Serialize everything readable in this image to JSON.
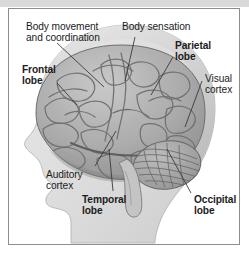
{
  "figure": {
    "frame_color": "#8d8d8d",
    "top_band_color": "#d9d9d9",
    "background_color": "#ffffff",
    "text_color": "#1c1c1c",
    "leader_line_color": "#3a3a3a"
  },
  "labels": [
    {
      "id": "body-movement",
      "text": "Body movement\nand coordination",
      "weight": "regular",
      "x": 17,
      "y": 12
    },
    {
      "id": "body-sensation",
      "text": "Body sensation",
      "weight": "regular",
      "x": 113,
      "y": 12
    },
    {
      "id": "parietal-lobe",
      "text": "Parietal\nlobe",
      "weight": "bold",
      "x": 166,
      "y": 31
    },
    {
      "id": "frontal-lobe",
      "text": "Frontal\nlobe",
      "weight": "bold",
      "x": 13,
      "y": 55
    },
    {
      "id": "visual-cortex",
      "text": "Visual\ncortex",
      "weight": "regular",
      "x": 196,
      "y": 64
    },
    {
      "id": "auditory-cortex",
      "text": "Auditory\ncortex",
      "weight": "regular",
      "x": 37,
      "y": 160
    },
    {
      "id": "temporal-lobe",
      "text": "Temporal\nlobe",
      "weight": "bold",
      "x": 73,
      "y": 185
    },
    {
      "id": "occipital-lobe",
      "text": "Occipital\nlobe",
      "weight": "bold",
      "x": 185,
      "y": 185
    }
  ],
  "anatomy": {
    "head_profile": "lateral view of human head facing left, shown in light grey silhouette",
    "structures": [
      "cerebrum with gyri and sulci",
      "cerebellum with striated folia",
      "brainstem"
    ]
  }
}
